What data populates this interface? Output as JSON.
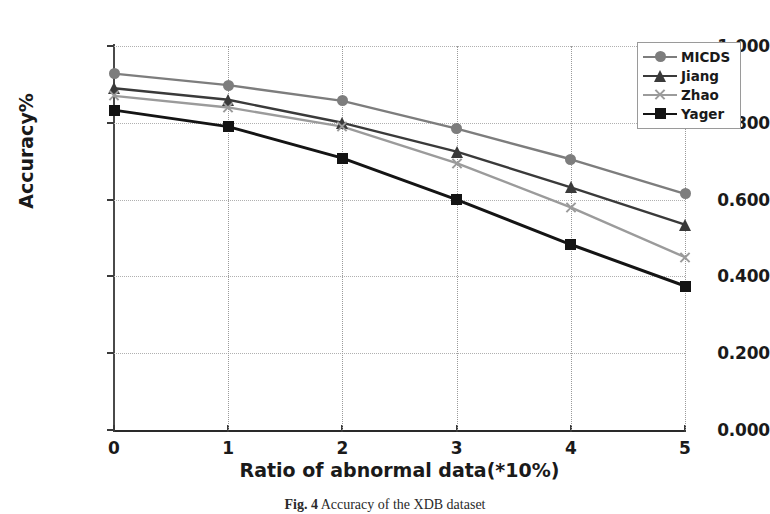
{
  "chart_data": {
    "type": "line",
    "title": "",
    "xlabel": "Ratio of abnormal data(*10%)",
    "ylabel": "Accuracy%",
    "x": [
      0,
      1,
      2,
      3,
      4,
      5
    ],
    "xtick_labels": [
      "0",
      "1",
      "2",
      "3",
      "4",
      "5"
    ],
    "ytick_labels": [
      "0.000",
      "0.200",
      "0.400",
      "0.600",
      "0.800",
      "1.000"
    ],
    "ytick_values": [
      0.0,
      0.2,
      0.4,
      0.6,
      0.8,
      1.0
    ],
    "xlim": [
      0,
      5
    ],
    "ylim": [
      0.0,
      1.0
    ],
    "grid": true,
    "grid_style": "dotted",
    "legend_position": "upper right",
    "series": [
      {
        "name": "MICDS",
        "marker": "circle",
        "color": "#7d7d7d",
        "values": [
          0.928,
          0.898,
          0.857,
          0.785,
          0.705,
          0.615
        ]
      },
      {
        "name": "Jiang",
        "marker": "triangle",
        "color": "#3a3a3a",
        "values": [
          0.89,
          0.86,
          0.8,
          0.725,
          0.632,
          0.535
        ]
      },
      {
        "name": "Zhao",
        "marker": "x",
        "color": "#9b9b9b",
        "values": [
          0.87,
          0.84,
          0.79,
          0.695,
          0.58,
          0.45
        ]
      },
      {
        "name": "Yager",
        "marker": "square",
        "color": "#141414",
        "values": [
          0.833,
          0.79,
          0.708,
          0.6,
          0.483,
          0.375
        ]
      }
    ]
  },
  "caption": {
    "figure_number": "Fig. 4",
    "text": "Accuracy of the XDB dataset"
  }
}
